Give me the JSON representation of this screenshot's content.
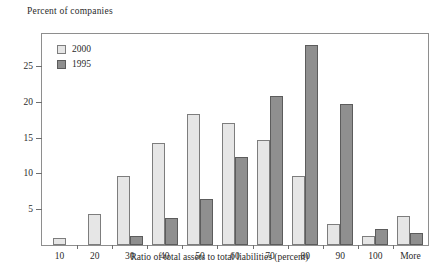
{
  "chart_data": {
    "type": "bar",
    "title": "",
    "ylabel": "Percent of companies",
    "xlabel": "Ratio of total assets to total liabilities (percent)",
    "categories": [
      "10",
      "20",
      "30",
      "40",
      "50",
      "60",
      "70",
      "80",
      "90",
      "100",
      "More"
    ],
    "series": [
      {
        "name": "2000",
        "color": "#e6e6e6",
        "values": [
          1.0,
          4.3,
          9.6,
          14.2,
          18.3,
          17.0,
          14.7,
          9.7,
          3.0,
          1.3,
          4.0
        ]
      },
      {
        "name": "1995",
        "color": "#8f8f8f",
        "values": [
          0.0,
          0.0,
          1.3,
          3.8,
          6.5,
          12.3,
          20.8,
          28.0,
          19.7,
          2.2,
          1.7
        ]
      }
    ],
    "yticks": [
      5,
      10,
      15,
      20,
      25
    ],
    "ytick_labels": [
      "5",
      "10",
      "15",
      "20",
      "25"
    ],
    "ylim": [
      0,
      29.5
    ],
    "grid": false,
    "legend_position": "top-left",
    "legend": [
      "2000",
      "1995"
    ]
  }
}
